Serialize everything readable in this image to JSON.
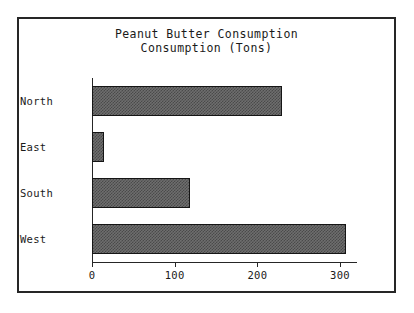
{
  "chart_data": {
    "type": "bar",
    "orientation": "horizontal",
    "title": "Peanut Butter Consumption",
    "subtitle": "Consumption (Tons)",
    "xlabel": "",
    "ylabel": "",
    "categories": [
      "North",
      "East",
      "South",
      "West"
    ],
    "values": [
      230,
      15,
      118,
      307
    ],
    "series": [
      {
        "name": "Consumption (Tons)",
        "values": [
          230,
          15,
          118,
          307
        ]
      }
    ],
    "xlim": [
      0,
      320
    ],
    "xticks": [
      0,
      100,
      200,
      300
    ],
    "xtick_labels": [
      "0",
      "100",
      "200",
      "300"
    ],
    "grid": false,
    "legend": false,
    "bar_color": "#6e6e6e",
    "bar_edge_color": "#151515",
    "bar_hatch": "dither-50",
    "frame_color": "#262626",
    "background_color": "#ffffff",
    "text_color": "#1a1a1a"
  }
}
